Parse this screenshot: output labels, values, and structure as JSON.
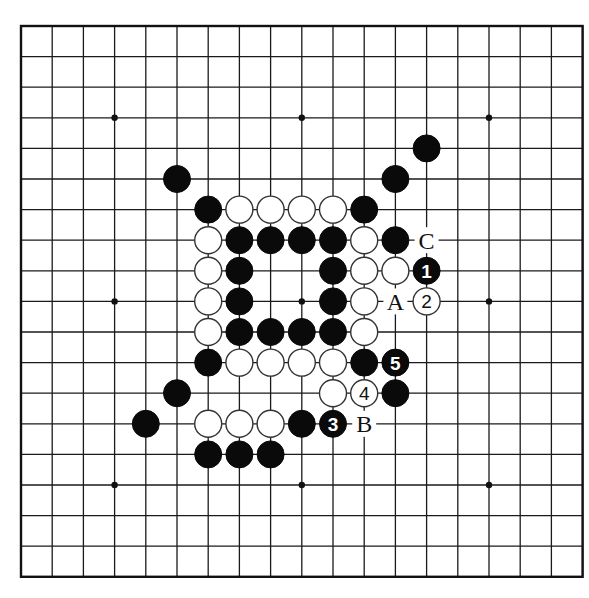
{
  "board": {
    "size": 19,
    "origin_x": 21,
    "origin_y": 26,
    "spacing_x": 31.2,
    "spacing_y": 30.6,
    "stone_radius": 13.5,
    "colors": {
      "line": "#1a1a1a",
      "black": "#0a0a0a",
      "white": "#ffffff",
      "background": "#ffffff"
    },
    "star_points": [
      [
        3,
        3
      ],
      [
        9,
        3
      ],
      [
        15,
        3
      ],
      [
        3,
        9
      ],
      [
        9,
        9
      ],
      [
        15,
        9
      ],
      [
        3,
        15
      ],
      [
        9,
        15
      ],
      [
        15,
        15
      ]
    ],
    "stones": [
      {
        "x": 13,
        "y": 4,
        "color": "black"
      },
      {
        "x": 5,
        "y": 5,
        "color": "black"
      },
      {
        "x": 12,
        "y": 5,
        "color": "black"
      },
      {
        "x": 6,
        "y": 6,
        "color": "black"
      },
      {
        "x": 7,
        "y": 6,
        "color": "white"
      },
      {
        "x": 8,
        "y": 6,
        "color": "white"
      },
      {
        "x": 9,
        "y": 6,
        "color": "white"
      },
      {
        "x": 10,
        "y": 6,
        "color": "white"
      },
      {
        "x": 11,
        "y": 6,
        "color": "black"
      },
      {
        "x": 6,
        "y": 7,
        "color": "white"
      },
      {
        "x": 7,
        "y": 7,
        "color": "black"
      },
      {
        "x": 8,
        "y": 7,
        "color": "black"
      },
      {
        "x": 9,
        "y": 7,
        "color": "black"
      },
      {
        "x": 10,
        "y": 7,
        "color": "black"
      },
      {
        "x": 11,
        "y": 7,
        "color": "white"
      },
      {
        "x": 12,
        "y": 7,
        "color": "black"
      },
      {
        "x": 6,
        "y": 8,
        "color": "white"
      },
      {
        "x": 7,
        "y": 8,
        "color": "black"
      },
      {
        "x": 10,
        "y": 8,
        "color": "black"
      },
      {
        "x": 11,
        "y": 8,
        "color": "white"
      },
      {
        "x": 12,
        "y": 8,
        "color": "white"
      },
      {
        "x": 13,
        "y": 8,
        "color": "black",
        "label": "1"
      },
      {
        "x": 6,
        "y": 9,
        "color": "white"
      },
      {
        "x": 7,
        "y": 9,
        "color": "black"
      },
      {
        "x": 10,
        "y": 9,
        "color": "black"
      },
      {
        "x": 11,
        "y": 9,
        "color": "white"
      },
      {
        "x": 13,
        "y": 9,
        "color": "white",
        "label": "2"
      },
      {
        "x": 6,
        "y": 10,
        "color": "white"
      },
      {
        "x": 7,
        "y": 10,
        "color": "black"
      },
      {
        "x": 8,
        "y": 10,
        "color": "black"
      },
      {
        "x": 9,
        "y": 10,
        "color": "black"
      },
      {
        "x": 10,
        "y": 10,
        "color": "black"
      },
      {
        "x": 11,
        "y": 10,
        "color": "white"
      },
      {
        "x": 6,
        "y": 11,
        "color": "black"
      },
      {
        "x": 7,
        "y": 11,
        "color": "white"
      },
      {
        "x": 8,
        "y": 11,
        "color": "white"
      },
      {
        "x": 9,
        "y": 11,
        "color": "white"
      },
      {
        "x": 10,
        "y": 11,
        "color": "white"
      },
      {
        "x": 11,
        "y": 11,
        "color": "black"
      },
      {
        "x": 12,
        "y": 11,
        "color": "black",
        "label": "5"
      },
      {
        "x": 5,
        "y": 12,
        "color": "black"
      },
      {
        "x": 10,
        "y": 12,
        "color": "white"
      },
      {
        "x": 11,
        "y": 12,
        "color": "white",
        "label": "4"
      },
      {
        "x": 12,
        "y": 12,
        "color": "black"
      },
      {
        "x": 4,
        "y": 13,
        "color": "black"
      },
      {
        "x": 6,
        "y": 13,
        "color": "white"
      },
      {
        "x": 7,
        "y": 13,
        "color": "white"
      },
      {
        "x": 8,
        "y": 13,
        "color": "white"
      },
      {
        "x": 9,
        "y": 13,
        "color": "black"
      },
      {
        "x": 10,
        "y": 13,
        "color": "black",
        "label": "3"
      },
      {
        "x": 6,
        "y": 14,
        "color": "black"
      },
      {
        "x": 7,
        "y": 14,
        "color": "black"
      },
      {
        "x": 8,
        "y": 14,
        "color": "black"
      }
    ],
    "letter_marks": [
      {
        "x": 13,
        "y": 7,
        "text": "C"
      },
      {
        "x": 12,
        "y": 9,
        "text": "A"
      },
      {
        "x": 11,
        "y": 13,
        "text": "B"
      }
    ]
  }
}
